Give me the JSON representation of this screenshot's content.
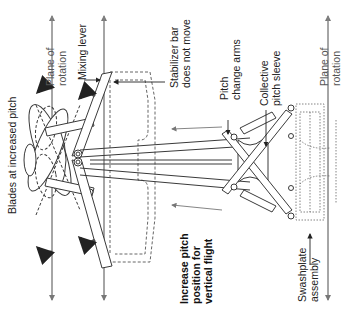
{
  "diagram": {
    "orientation": "rotated 90 degrees counterclockwise",
    "labels": {
      "plane_of_rotation_top": "Plane of\nrotation",
      "mixing_lever": "Mixing lever",
      "stabilizer_bar": "Stabilizer bar\ndoes not move",
      "pitch_change_arms": "Pitch\nchange arms",
      "collective_pitch_sleeve": "Collective\npitch sleeve",
      "plane_of_rotation_right": "Plane of\nrotation",
      "blades_increased_pitch": "Blades at increased pitch",
      "increase_pitch": "Increase pitch\nposition for\nvertical flight",
      "swashplate_assembly": "Swashplate\nassembly"
    },
    "colors": {
      "line": "#3a3a3a",
      "dashed": "#555555",
      "motion_arrow": "#4a4a4a",
      "axis": "#888888"
    }
  }
}
